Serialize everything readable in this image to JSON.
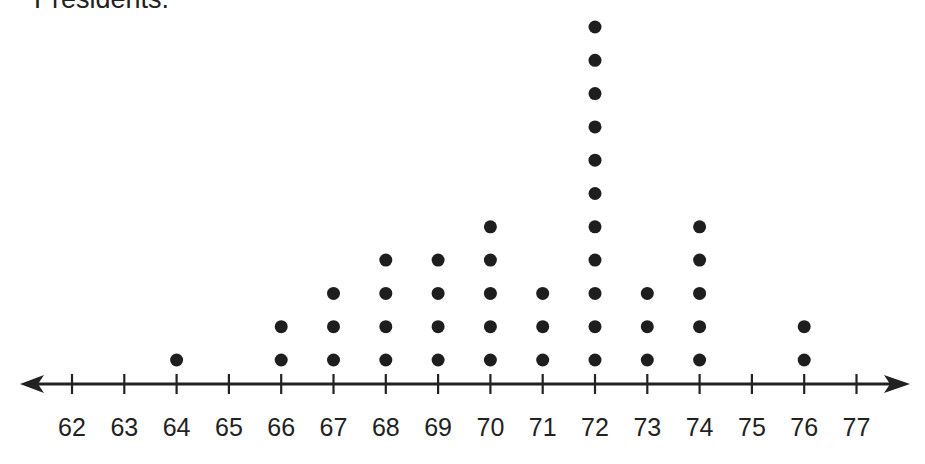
{
  "caption": "Presidents.",
  "colors": {
    "ink": "#222222",
    "dot": "#1e1e1e",
    "background": "#ffffff"
  },
  "chart_data": {
    "type": "dot_plot",
    "title": "Presidents.",
    "xlabel": "",
    "ylabel": "",
    "x_ticks": [
      62,
      63,
      64,
      65,
      66,
      67,
      68,
      69,
      70,
      71,
      72,
      73,
      74,
      75,
      76,
      77
    ],
    "xlim": [
      62,
      77
    ],
    "grid": false,
    "categories": [
      62,
      63,
      64,
      65,
      66,
      67,
      68,
      69,
      70,
      71,
      72,
      73,
      74,
      75,
      76,
      77
    ],
    "values": [
      0,
      0,
      1,
      0,
      2,
      3,
      4,
      4,
      5,
      3,
      11,
      3,
      5,
      0,
      2,
      0
    ],
    "total_dots": 43
  }
}
